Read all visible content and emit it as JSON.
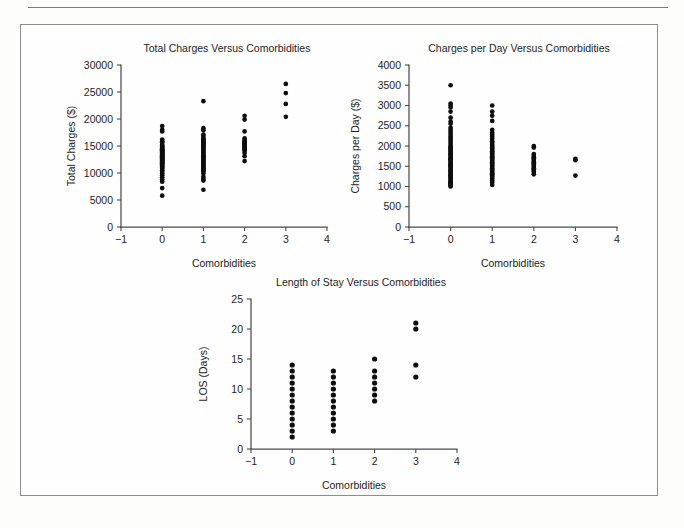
{
  "figure": {
    "background_color": "#fefefe",
    "frame_color": "#8c8c8c",
    "point_color": "#0d0d0d",
    "axis_color": "#4a4a4a"
  },
  "charts": [
    {
      "id": "total-charges-vs-comorbidities",
      "title": "Total Charges Versus Comorbidities",
      "xlabel": "Comorbidities",
      "ylabel": "Total Charges ($)",
      "xticks": [
        "−1",
        "0",
        "1",
        "2",
        "3",
        "4"
      ],
      "yticks": [
        "0",
        "5000",
        "10000",
        "15000",
        "20000",
        "25000",
        "30000"
      ]
    },
    {
      "id": "charges-per-day-vs-comorbidities",
      "title": "Charges per Day Versus Comorbidities",
      "xlabel": "Comorbidities",
      "ylabel": "Charges per Day ($)",
      "xticks": [
        "−1",
        "0",
        "1",
        "2",
        "3",
        "4"
      ],
      "yticks": [
        "0",
        "500",
        "1000",
        "1500",
        "2000",
        "2500",
        "3000",
        "3500",
        "4000"
      ]
    },
    {
      "id": "length-of-stay-vs-comorbidities",
      "title": "Length of Stay Versus Comorbidities",
      "xlabel": "Comorbidities",
      "ylabel": "LOS (Days)",
      "xticks": [
        "−1",
        "0",
        "1",
        "2",
        "3",
        "4"
      ],
      "yticks": [
        "0",
        "5",
        "10",
        "15",
        "20",
        "25"
      ]
    }
  ],
  "chart_data": [
    {
      "type": "scatter",
      "title": "Total Charges Versus Comorbidities",
      "xlabel": "Comorbidities",
      "ylabel": "Total Charges ($)",
      "xlim": [
        -1,
        4
      ],
      "ylim": [
        0,
        30000
      ],
      "xticks": [
        -1,
        0,
        1,
        2,
        3,
        4
      ],
      "yticks": [
        0,
        5000,
        10000,
        15000,
        20000,
        25000,
        30000
      ],
      "grid": false,
      "legend": "none",
      "series": [
        {
          "name": "patients",
          "x": [
            0,
            0,
            0,
            0,
            0,
            0,
            0,
            0,
            0,
            0,
            0,
            0,
            0,
            0,
            0,
            0,
            0,
            0,
            0,
            0,
            0,
            0,
            0,
            0,
            0,
            0,
            0,
            0,
            0,
            0,
            0,
            0,
            0,
            0,
            0,
            0,
            0,
            0,
            0,
            0,
            0,
            0,
            0,
            0,
            0,
            0,
            0,
            0,
            0,
            0,
            0,
            0,
            1,
            1,
            1,
            1,
            1,
            1,
            1,
            1,
            1,
            1,
            1,
            1,
            1,
            1,
            1,
            1,
            1,
            1,
            1,
            1,
            1,
            1,
            1,
            1,
            1,
            1,
            1,
            1,
            1,
            1,
            1,
            1,
            1,
            1,
            1,
            1,
            1,
            1,
            1,
            1,
            1,
            1,
            2,
            2,
            2,
            2,
            2,
            2,
            2,
            2,
            2,
            2,
            2,
            2,
            2,
            2,
            2,
            2,
            2,
            2,
            3,
            3,
            3,
            3
          ],
          "y": [
            18700,
            18000,
            17700,
            16200,
            15900,
            15700,
            15300,
            15000,
            14900,
            14800,
            14600,
            14400,
            14300,
            14200,
            14100,
            14000,
            13900,
            13800,
            13700,
            13600,
            13500,
            13400,
            13300,
            13200,
            13100,
            13000,
            12900,
            12800,
            12700,
            12600,
            12500,
            12400,
            12300,
            12200,
            12100,
            12000,
            11900,
            11800,
            11600,
            11400,
            11200,
            11000,
            10800,
            10500,
            10200,
            9900,
            9600,
            9200,
            8800,
            8400,
            7200,
            5800,
            23300,
            18300,
            17900,
            17100,
            16900,
            16500,
            16300,
            16100,
            15900,
            15700,
            15500,
            15300,
            15100,
            14900,
            14700,
            14500,
            14300,
            14100,
            13900,
            13700,
            13500,
            13300,
            13100,
            12900,
            12700,
            12500,
            12300,
            12100,
            11900,
            11700,
            11500,
            11300,
            11100,
            10900,
            10700,
            10500,
            10300,
            9900,
            9300,
            8900,
            8600,
            6900,
            20600,
            19900,
            17700,
            16400,
            16100,
            15900,
            15700,
            15500,
            15300,
            15100,
            14900,
            14700,
            14500,
            14300,
            14100,
            13700,
            13100,
            12200,
            26500,
            24800,
            22800,
            20400
          ]
        }
      ]
    },
    {
      "type": "scatter",
      "title": "Charges per Day Versus Comorbidities",
      "xlabel": "Comorbidities",
      "ylabel": "Charges per Day ($)",
      "xlim": [
        -1,
        4
      ],
      "ylim": [
        0,
        4000
      ],
      "xticks": [
        -1,
        0,
        1,
        2,
        3,
        4
      ],
      "yticks": [
        0,
        500,
        1000,
        1500,
        2000,
        2500,
        3000,
        3500,
        4000
      ],
      "grid": false,
      "legend": "none",
      "series": [
        {
          "name": "patients",
          "x": [
            0,
            0,
            0,
            0,
            0,
            0,
            0,
            0,
            0,
            0,
            0,
            0,
            0,
            0,
            0,
            0,
            0,
            0,
            0,
            0,
            0,
            0,
            0,
            0,
            0,
            0,
            0,
            0,
            0,
            0,
            0,
            0,
            0,
            0,
            0,
            0,
            0,
            0,
            0,
            0,
            0,
            0,
            0,
            0,
            0,
            0,
            0,
            0,
            0,
            0,
            0,
            0,
            1,
            1,
            1,
            1,
            1,
            1,
            1,
            1,
            1,
            1,
            1,
            1,
            1,
            1,
            1,
            1,
            1,
            1,
            1,
            1,
            1,
            1,
            1,
            1,
            1,
            1,
            1,
            1,
            1,
            1,
            1,
            1,
            1,
            1,
            1,
            1,
            1,
            1,
            1,
            1,
            1,
            1,
            2,
            2,
            2,
            2,
            2,
            2,
            2,
            2,
            2,
            2,
            2,
            2,
            2,
            2,
            2,
            2,
            2,
            2,
            3,
            3,
            3
          ],
          "y": [
            3500,
            3050,
            3000,
            2950,
            2850,
            2700,
            2600,
            2550,
            2450,
            2400,
            2350,
            2300,
            2250,
            2200,
            2150,
            2100,
            2050,
            2000,
            1970,
            1940,
            1910,
            1880,
            1850,
            1820,
            1790,
            1760,
            1730,
            1700,
            1670,
            1640,
            1610,
            1580,
            1550,
            1520,
            1490,
            1460,
            1430,
            1400,
            1370,
            1340,
            1310,
            1280,
            1250,
            1220,
            1190,
            1160,
            1130,
            1100,
            1080,
            1050,
            1020,
            1000,
            3000,
            2850,
            2750,
            2620,
            2400,
            2330,
            2280,
            2230,
            2180,
            2120,
            2080,
            2030,
            2000,
            1960,
            1930,
            1900,
            1870,
            1840,
            1810,
            1780,
            1750,
            1720,
            1690,
            1660,
            1630,
            1600,
            1570,
            1540,
            1510,
            1480,
            1450,
            1420,
            1390,
            1360,
            1330,
            1300,
            1270,
            1240,
            1200,
            1150,
            1100,
            1040,
            2000,
            1960,
            1800,
            1760,
            1720,
            1690,
            1660,
            1630,
            1600,
            1570,
            1540,
            1510,
            1480,
            1450,
            1420,
            1390,
            1360,
            1300,
            1680,
            1650,
            1270
          ]
        }
      ]
    },
    {
      "type": "scatter",
      "title": "Length of Stay Versus Comorbidities",
      "xlabel": "Comorbidities",
      "ylabel": "LOS (Days)",
      "xlim": [
        -1,
        4
      ],
      "ylim": [
        0,
        25
      ],
      "xticks": [
        -1,
        0,
        1,
        2,
        3,
        4
      ],
      "yticks": [
        0,
        5,
        10,
        15,
        20,
        25
      ],
      "grid": false,
      "legend": "none",
      "series": [
        {
          "name": "patients",
          "x": [
            0,
            0,
            0,
            0,
            0,
            0,
            0,
            0,
            0,
            0,
            0,
            0,
            0,
            1,
            1,
            1,
            1,
            1,
            1,
            1,
            1,
            1,
            1,
            1,
            2,
            2,
            2,
            2,
            2,
            2,
            2,
            3,
            3,
            3,
            3
          ],
          "y": [
            2,
            3,
            4,
            5,
            6,
            7,
            8,
            9,
            10,
            11,
            12,
            13,
            14,
            3,
            4,
            5,
            6,
            7,
            8,
            9,
            10,
            11,
            12,
            13,
            8,
            9,
            10,
            11,
            12,
            13,
            15,
            12,
            14,
            20,
            21
          ]
        }
      ]
    }
  ]
}
